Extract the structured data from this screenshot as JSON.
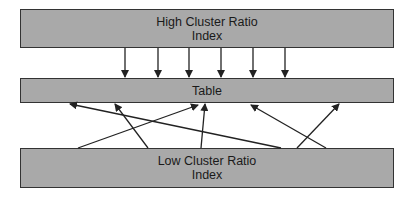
{
  "diagram": {
    "boxes": {
      "high_cluster": {
        "line1": "High Cluster Ratio",
        "line2": "Index"
      },
      "table": {
        "label": "Table"
      },
      "low_cluster": {
        "line1": "Low Cluster Ratio",
        "line2": "Index"
      }
    },
    "colors": {
      "box_fill": "#a9a9a9",
      "border": "#333333",
      "arrow": "#222222"
    },
    "arrows_high_to_table": [
      {
        "x1": 125,
        "y1": 48,
        "x2": 125,
        "y2": 77
      },
      {
        "x1": 158,
        "y1": 48,
        "x2": 158,
        "y2": 77
      },
      {
        "x1": 189,
        "y1": 48,
        "x2": 189,
        "y2": 77
      },
      {
        "x1": 221,
        "y1": 48,
        "x2": 221,
        "y2": 77
      },
      {
        "x1": 253,
        "y1": 48,
        "x2": 253,
        "y2": 77
      },
      {
        "x1": 285,
        "y1": 48,
        "x2": 285,
        "y2": 77
      }
    ],
    "arrows_low_to_table": [
      {
        "x1": 281,
        "y1": 148,
        "x2": 70,
        "y2": 104
      },
      {
        "x1": 148,
        "y1": 148,
        "x2": 115,
        "y2": 104
      },
      {
        "x1": 78,
        "y1": 148,
        "x2": 198,
        "y2": 105
      },
      {
        "x1": 201,
        "y1": 148,
        "x2": 205,
        "y2": 104
      },
      {
        "x1": 326,
        "y1": 148,
        "x2": 251,
        "y2": 105
      },
      {
        "x1": 297,
        "y1": 148,
        "x2": 339,
        "y2": 104
      }
    ]
  }
}
